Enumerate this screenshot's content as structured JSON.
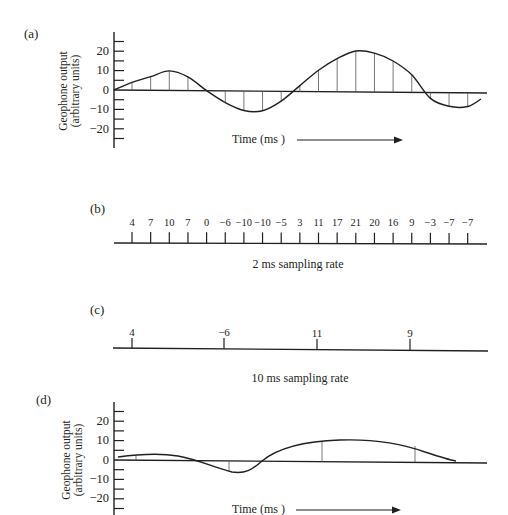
{
  "panels": {
    "a": {
      "label": "(a)",
      "ylabel_line1": "Geophone output",
      "ylabel_line2": "(arbitrary units)",
      "yticks": [
        "20",
        "10",
        "0",
        "−10",
        "−20"
      ],
      "xlabel": "Time (ms )"
    },
    "b": {
      "label": "(b)",
      "caption": "2 ms sampling rate",
      "values": [
        "4",
        "7",
        "10",
        "7",
        "0",
        "−6",
        "−10",
        "−10",
        "−5",
        "3",
        "11",
        "17",
        "21",
        "20",
        "16",
        "9",
        "−3",
        "−7",
        "−7"
      ]
    },
    "c": {
      "label": "(c)",
      "caption": "10 ms sampling rate",
      "values": [
        "4",
        "−6",
        "11",
        "9"
      ]
    },
    "d": {
      "label": "(d)",
      "ylabel_line1": "Geophone output",
      "ylabel_line2": "(arbitrary units)",
      "yticks": [
        "20",
        "10",
        "0",
        "−10",
        "−20"
      ],
      "xlabel": "Time (ms )"
    }
  },
  "chart_data": [
    {
      "type": "line",
      "title": "(a) Continuous geophone output with sample stems",
      "xlabel": "Time (ms)",
      "ylabel": "Geophone output (arbitrary units)",
      "ylim": [
        -30,
        30
      ],
      "yticks": [
        20,
        10,
        0,
        -10,
        -20
      ],
      "grid": false,
      "x": [
        0,
        2,
        4,
        6,
        8,
        10,
        12,
        14,
        16,
        18,
        20,
        22,
        24,
        26,
        28,
        30,
        32,
        34,
        36
      ],
      "values": [
        4,
        7,
        10,
        7,
        0,
        -6,
        -10,
        -10,
        -5,
        3,
        11,
        17,
        21,
        20,
        16,
        9,
        -3,
        -7,
        -7
      ]
    },
    {
      "type": "table",
      "title": "(b) 2 ms sampling rate",
      "x": [
        0,
        2,
        4,
        6,
        8,
        10,
        12,
        14,
        16,
        18,
        20,
        22,
        24,
        26,
        28,
        30,
        32,
        34,
        36
      ],
      "values": [
        4,
        7,
        10,
        7,
        0,
        -6,
        -10,
        -10,
        -5,
        3,
        11,
        17,
        21,
        20,
        16,
        9,
        -3,
        -7,
        -7
      ]
    },
    {
      "type": "table",
      "title": "(c) 10 ms sampling rate",
      "x": [
        0,
        10,
        20,
        30
      ],
      "values": [
        4,
        -6,
        11,
        9
      ]
    },
    {
      "type": "line",
      "title": "(d) Reconstructed (aliased) signal from 10 ms samples",
      "xlabel": "Time (ms)",
      "ylabel": "Geophone output (arbitrary units)",
      "ylim": [
        -30,
        30
      ],
      "yticks": [
        20,
        10,
        0,
        -10,
        -20
      ],
      "grid": false,
      "x": [
        0,
        10,
        20,
        30
      ],
      "values": [
        4,
        -6,
        11,
        9
      ]
    }
  ],
  "colors": {
    "ink": "#231f20",
    "stem": "#555555",
    "background": "#ffffff"
  }
}
